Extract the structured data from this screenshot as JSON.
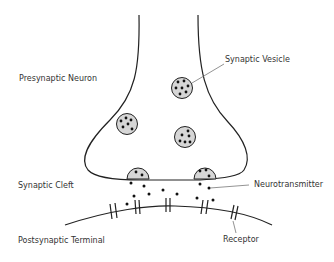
{
  "labels": {
    "presynaptic": "Presynaptic Neuron",
    "vesicle": "Synaptic Vesicle",
    "cleft": "Synaptic Cleft",
    "neurotransmitter": "Neurotransmitter",
    "postsynaptic": "Postsynaptic Terminal",
    "receptor": "Receptor"
  },
  "colors": {
    "stroke": "#222222",
    "vesicle_fill": "#d6d6d6",
    "leader": "#777777",
    "text": "#333333"
  }
}
